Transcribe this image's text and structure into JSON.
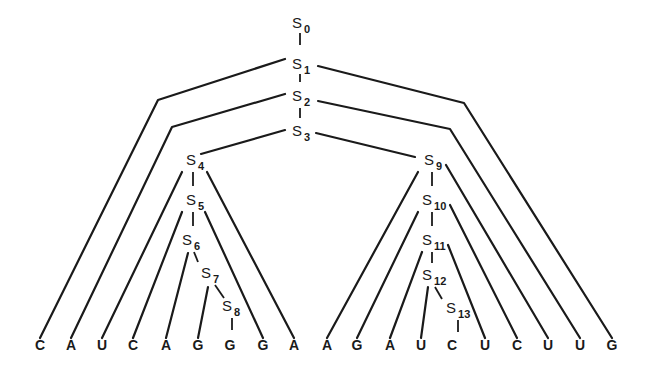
{
  "diagram": {
    "nodes": [
      {
        "id": "S0",
        "base": "S",
        "sub": "0",
        "x": 292,
        "y": 28
      },
      {
        "id": "S1",
        "base": "S",
        "sub": "1",
        "x": 292,
        "y": 69
      },
      {
        "id": "S2",
        "base": "S",
        "sub": "2",
        "x": 292,
        "y": 101
      },
      {
        "id": "S3",
        "base": "S",
        "sub": "3",
        "x": 292,
        "y": 136
      },
      {
        "id": "S4",
        "base": "S",
        "sub": "4",
        "x": 186,
        "y": 165
      },
      {
        "id": "S5",
        "base": "S",
        "sub": "5",
        "x": 186,
        "y": 205
      },
      {
        "id": "S6",
        "base": "S",
        "sub": "6",
        "x": 182,
        "y": 245
      },
      {
        "id": "S7",
        "base": "S",
        "sub": "7",
        "x": 201,
        "y": 278
      },
      {
        "id": "S8",
        "base": "S",
        "sub": "8",
        "x": 222,
        "y": 311
      },
      {
        "id": "S9",
        "base": "S",
        "sub": "9",
        "x": 424,
        "y": 165
      },
      {
        "id": "S10",
        "base": "S",
        "sub": "10",
        "x": 422,
        "y": 205
      },
      {
        "id": "S11",
        "base": "S",
        "sub": "11",
        "x": 422,
        "y": 245
      },
      {
        "id": "S12",
        "base": "S",
        "sub": "12",
        "x": 422,
        "y": 280
      },
      {
        "id": "S13",
        "base": "S",
        "sub": "13",
        "x": 446,
        "y": 313
      }
    ],
    "leaves": [
      {
        "label": "C",
        "x": 40
      },
      {
        "label": "A",
        "x": 71
      },
      {
        "label": "U",
        "x": 102
      },
      {
        "label": "C",
        "x": 133
      },
      {
        "label": "A",
        "x": 166
      },
      {
        "label": "G",
        "x": 198
      },
      {
        "label": "G",
        "x": 230
      },
      {
        "label": "G",
        "x": 263
      },
      {
        "label": "A",
        "x": 294
      },
      {
        "label": "A",
        "x": 327
      },
      {
        "label": "G",
        "x": 357
      },
      {
        "label": "A",
        "x": 390
      },
      {
        "label": "U",
        "x": 421
      },
      {
        "label": "C",
        "x": 452
      },
      {
        "label": "U",
        "x": 485
      },
      {
        "label": "C",
        "x": 517
      },
      {
        "label": "U",
        "x": 548
      },
      {
        "label": "U",
        "x": 580
      },
      {
        "label": "G",
        "x": 612
      }
    ],
    "leaf_y": 350,
    "chain_links": [
      [
        300,
        33,
        300,
        45
      ],
      [
        300,
        74,
        300,
        82
      ],
      [
        300,
        108,
        300,
        118
      ],
      [
        193,
        172,
        193,
        186
      ],
      [
        193,
        212,
        193,
        226
      ],
      [
        194,
        252,
        198,
        262
      ],
      [
        215,
        285,
        224,
        298
      ],
      [
        232,
        318,
        232,
        330
      ],
      [
        432,
        172,
        432,
        186
      ],
      [
        432,
        212,
        432,
        226
      ],
      [
        432,
        252,
        432,
        263
      ],
      [
        435,
        287,
        442,
        299
      ],
      [
        458,
        320,
        458,
        332
      ]
    ],
    "edges": [
      {
        "from": "S1-left",
        "points": [
          [
            285,
            59
          ],
          [
            158,
            100
          ],
          [
            40,
            338
          ]
        ]
      },
      {
        "from": "S1-right",
        "points": [
          [
            318,
            66
          ],
          [
            464,
            103
          ],
          [
            612,
            338
          ]
        ]
      },
      {
        "from": "S2-left",
        "points": [
          [
            285,
            94
          ],
          [
            172,
            127
          ],
          [
            71,
            338
          ]
        ]
      },
      {
        "from": "S2-right",
        "points": [
          [
            318,
            101
          ],
          [
            450,
            129
          ],
          [
            580,
            338
          ]
        ]
      },
      {
        "from": "S3-left",
        "points": [
          [
            285,
            130
          ],
          [
            201,
            154
          ]
        ]
      },
      {
        "from": "S3-right",
        "points": [
          [
            316,
            133
          ],
          [
            415,
            157
          ]
        ]
      },
      {
        "from": "S4-left",
        "points": [
          [
            182,
            172
          ],
          [
            102,
            338
          ]
        ]
      },
      {
        "from": "S4-right",
        "points": [
          [
            207,
            172
          ],
          [
            294,
            338
          ]
        ]
      },
      {
        "from": "S5-left",
        "points": [
          [
            182,
            212
          ],
          [
            133,
            338
          ]
        ]
      },
      {
        "from": "S5-right",
        "points": [
          [
            205,
            212
          ],
          [
            263,
            338
          ]
        ]
      },
      {
        "from": "S6-left",
        "points": [
          [
            188,
            253
          ],
          [
            166,
            338
          ]
        ]
      },
      {
        "from": "S7-left",
        "points": [
          [
            208,
            287
          ],
          [
            198,
            338
          ]
        ]
      },
      {
        "from": "S9-left",
        "points": [
          [
            418,
            172
          ],
          [
            327,
            338
          ]
        ]
      },
      {
        "from": "S9-right",
        "points": [
          [
            446,
            165
          ],
          [
            548,
            338
          ]
        ]
      },
      {
        "from": "S10-left",
        "points": [
          [
            418,
            212
          ],
          [
            357,
            338
          ]
        ]
      },
      {
        "from": "S10-right",
        "points": [
          [
            450,
            205
          ],
          [
            517,
            338
          ]
        ]
      },
      {
        "from": "S11-left",
        "points": [
          [
            422,
            252
          ],
          [
            390,
            338
          ]
        ]
      },
      {
        "from": "S11-right",
        "points": [
          [
            448,
            245
          ],
          [
            485,
            338
          ]
        ]
      },
      {
        "from": "S12-left",
        "points": [
          [
            428,
            287
          ],
          [
            421,
            338
          ]
        ]
      }
    ]
  }
}
